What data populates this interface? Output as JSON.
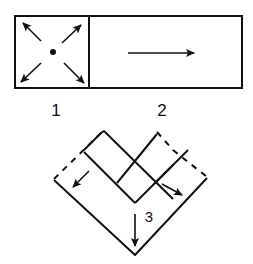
{
  "diagram": {
    "steps": [
      {
        "number": "1",
        "description": "square with dot in center and four diagonal arrows pointing outward to corners"
      },
      {
        "number": "2",
        "description": "rectangle with a single arrow pointing right"
      },
      {
        "number": "3",
        "description": "V-shaped folded strips with dashed outer edges and arrows pointing outward-down"
      }
    ],
    "labels": {
      "step1": "1",
      "step2": "2",
      "step3": "3"
    },
    "colors": {
      "stroke": "#111111",
      "background": "#ffffff"
    }
  }
}
